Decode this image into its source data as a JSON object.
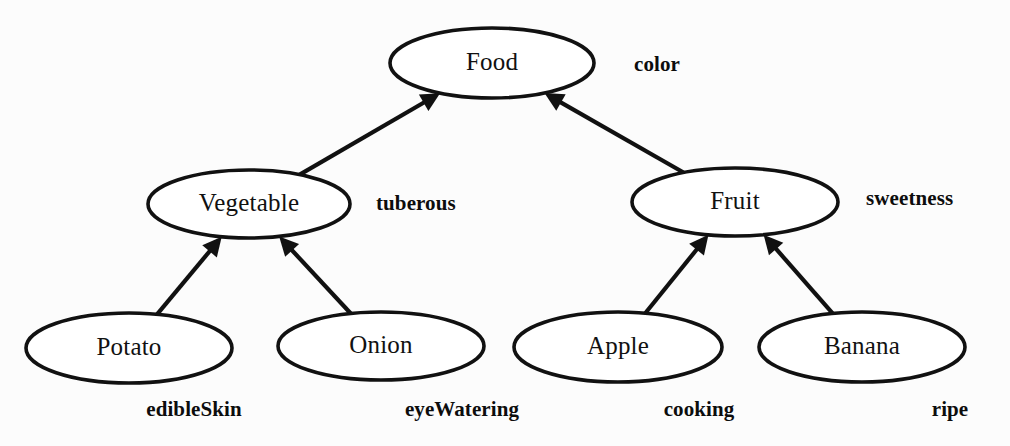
{
  "diagram": {
    "type": "class-hierarchy-tree",
    "background_color": "#fcfcfc",
    "stroke_color": "#111111",
    "node_fill_color": "#ffffff",
    "nodes": [
      {
        "id": "food",
        "label": "Food",
        "level": 0,
        "cx": 492,
        "cy": 63,
        "rx": 102,
        "ry": 35
      },
      {
        "id": "vegetable",
        "label": "Vegetable",
        "level": 1,
        "cx": 249,
        "cy": 204,
        "rx": 101,
        "ry": 34
      },
      {
        "id": "fruit",
        "label": "Fruit",
        "level": 1,
        "cx": 735,
        "cy": 202,
        "rx": 103,
        "ry": 34
      },
      {
        "id": "potato",
        "label": "Potato",
        "level": 2,
        "cx": 129,
        "cy": 348,
        "rx": 103,
        "ry": 35
      },
      {
        "id": "onion",
        "label": "Onion",
        "level": 2,
        "cx": 381,
        "cy": 346,
        "rx": 103,
        "ry": 34
      },
      {
        "id": "apple",
        "label": "Apple",
        "level": 2,
        "cx": 618,
        "cy": 347,
        "rx": 104,
        "ry": 35
      },
      {
        "id": "banana",
        "label": "Banana",
        "level": 2,
        "cx": 862,
        "cy": 347,
        "rx": 103,
        "ry": 35
      }
    ],
    "edges": [
      {
        "id": "edge-vegetable-food",
        "from": "vegetable",
        "to": "food",
        "arrow_at": "parent"
      },
      {
        "id": "edge-fruit-food",
        "from": "fruit",
        "to": "food",
        "arrow_at": "parent"
      },
      {
        "id": "edge-potato-vegetable",
        "from": "potato",
        "to": "vegetable",
        "arrow_at": "parent"
      },
      {
        "id": "edge-onion-vegetable",
        "from": "onion",
        "to": "vegetable",
        "arrow_at": "parent"
      },
      {
        "id": "edge-apple-fruit",
        "from": "apple",
        "to": "fruit",
        "arrow_at": "parent"
      },
      {
        "id": "edge-banana-fruit",
        "from": "banana",
        "to": "fruit",
        "arrow_at": "parent"
      }
    ],
    "attributes": [
      {
        "id": "attr-color",
        "label": "color",
        "owner": "food",
        "x": 634,
        "y": 66,
        "anchor": "start"
      },
      {
        "id": "attr-tuberous",
        "label": "tuberous",
        "owner": "vegetable",
        "x": 376,
        "y": 205,
        "anchor": "start"
      },
      {
        "id": "attr-sweetness",
        "label": "sweetness",
        "owner": "fruit",
        "x": 866,
        "y": 200,
        "anchor": "start"
      },
      {
        "id": "attr-edibleskin",
        "label": "edibleSkin",
        "owner": "potato",
        "x": 194,
        "y": 411,
        "anchor": "middle"
      },
      {
        "id": "attr-eyewatering",
        "label": "eyeWatering",
        "owner": "onion",
        "x": 462,
        "y": 411,
        "anchor": "middle"
      },
      {
        "id": "attr-cooking",
        "label": "cooking",
        "owner": "apple",
        "x": 699,
        "y": 411,
        "anchor": "middle"
      },
      {
        "id": "attr-ripe",
        "label": "ripe",
        "owner": "banana",
        "x": 950,
        "y": 411,
        "anchor": "middle"
      }
    ]
  }
}
